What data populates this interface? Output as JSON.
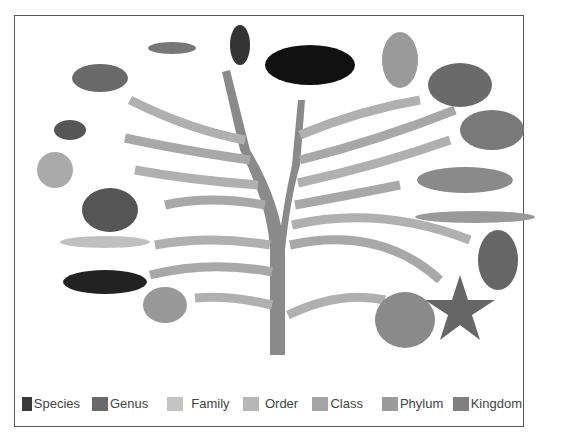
{
  "diagram": {
    "type": "phylogenetic-tree",
    "organisms_left": [
      "crab",
      "centipede",
      "beetle",
      "spider",
      "fan worm",
      "snail",
      "bristle worm",
      "sea cucumber",
      "jellyfish"
    ],
    "organisms_top": [
      "cat",
      "bird",
      "tortoise"
    ],
    "organisms_right": [
      "frog",
      "fish",
      "lancelet",
      "sea squirt",
      "starfish",
      "sponge"
    ]
  },
  "legend": {
    "items": [
      {
        "label": "Species",
        "color": "#3a3a3a"
      },
      {
        "label": "Genus",
        "color": "#6a6a6a"
      },
      {
        "label": "Family",
        "color": "#c4c4c4"
      },
      {
        "label": "Order",
        "color": "#b8b8b8"
      },
      {
        "label": "Class",
        "color": "#a6a6a6"
      },
      {
        "label": "Phylum",
        "color": "#9a9a9a"
      },
      {
        "label": "Kingdom",
        "color": "#808080"
      }
    ]
  }
}
